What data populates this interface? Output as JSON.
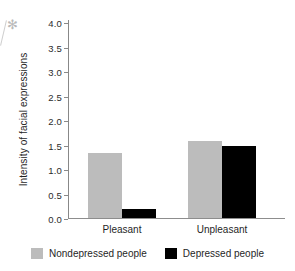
{
  "chart_data": {
    "type": "bar",
    "title": "",
    "xlabel": "",
    "ylabel": "Intensity of facial expressions",
    "categories": [
      "Pleasant",
      "Unpleasant"
    ],
    "series": [
      {
        "name": "Nondepressed people",
        "color": "#bcbcbc",
        "values": [
          1.35,
          1.6
        ]
      },
      {
        "name": "Depressed people",
        "color": "#000000",
        "values": [
          0.2,
          1.5
        ]
      }
    ],
    "ylim": [
      0.0,
      4.0
    ],
    "yticks": [
      "0.0",
      "0.5",
      "1.0",
      "1.5",
      "2.0",
      "2.5",
      "3.0",
      "3.5",
      "4.0"
    ],
    "ytick_values": [
      0.0,
      0.5,
      1.0,
      1.5,
      2.0,
      2.5,
      3.0,
      3.5,
      4.0
    ],
    "grid": false,
    "legend_position": "bottom"
  },
  "legend": {
    "items": [
      {
        "label": "Nondepressed people",
        "color": "#bcbcbc"
      },
      {
        "label": "Depressed people",
        "color": "#000000"
      }
    ]
  },
  "artifact": {
    "mark": "✻"
  }
}
